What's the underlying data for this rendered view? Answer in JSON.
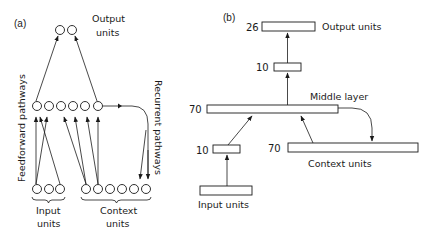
{
  "panel_a": {
    "tag": "(a)",
    "output_label_1": "Output",
    "output_label_2": "units",
    "input_label_1": "Input",
    "input_label_2": "units",
    "context_label_1": "Context",
    "context_label_2": "units",
    "feedforward_label": "Feedforward  pathways",
    "recurrent_label": "Recurrent  pathways",
    "output_units_count": 2,
    "middle_units_count": 6,
    "input_units_count": 3,
    "context_units_count": 6
  },
  "panel_b": {
    "tag": "(b)",
    "output": {
      "count": "26",
      "label": "Output units"
    },
    "hidden_top": {
      "count": "10"
    },
    "middle": {
      "count": "70",
      "label": "Middle layer"
    },
    "hidden_input": {
      "count": "10"
    },
    "context": {
      "count": "70",
      "label": "Context units"
    },
    "input": {
      "label": "Input units"
    }
  }
}
